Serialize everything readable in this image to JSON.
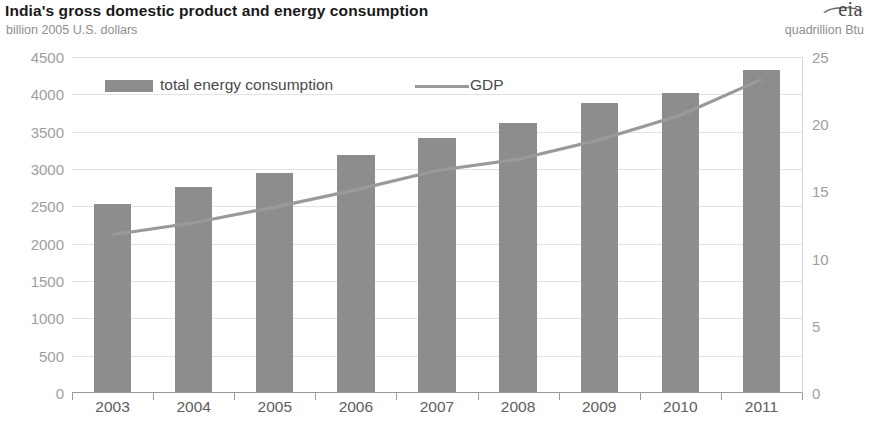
{
  "header": {
    "title": "India's gross domestic product and energy consumption",
    "subtitle_left": "billion 2005 U.S. dollars",
    "subtitle_right": "quadrillion Btu",
    "logo": "eia"
  },
  "legend": {
    "bars_label": "total energy consumption",
    "line_label": "GDP"
  },
  "colors": {
    "bar": "#8d8d8d",
    "line": "#9a9a9a",
    "grid": "#e2e2e2",
    "axis": "#9a9a9a",
    "title": "#1a1a1a",
    "tick": "#9e9e9e"
  },
  "chart_data": {
    "type": "bar",
    "title": "India's gross domestic product and energy consumption",
    "xlabel": "",
    "ylabel": "billion 2005 U.S. dollars",
    "y2label": "quadrillion Btu",
    "categories": [
      "2003",
      "2004",
      "2005",
      "2006",
      "2007",
      "2008",
      "2009",
      "2010",
      "2011"
    ],
    "ylim": [
      0,
      4500
    ],
    "y2lim": [
      0,
      25
    ],
    "yticks": [
      0,
      500,
      1000,
      1500,
      2000,
      2500,
      3000,
      3500,
      4000,
      4500
    ],
    "ytick_labels": [
      "0",
      "500",
      "1000",
      "1500",
      "2000",
      "2500",
      "3000",
      "3500",
      "4000",
      "4500"
    ],
    "y2ticks": [
      0,
      5,
      10,
      15,
      20,
      25
    ],
    "y2tick_labels": [
      "0",
      "5",
      "10",
      "15",
      "20",
      "25"
    ],
    "grid": true,
    "legend_position": "top-left",
    "series": [
      {
        "name": "total energy consumption",
        "type": "bar",
        "axis": "right",
        "units": "quadrillion Btu",
        "values": [
          14.1,
          15.3,
          16.4,
          17.7,
          19.0,
          20.1,
          21.6,
          22.3,
          24.0
        ]
      },
      {
        "name": "GDP",
        "type": "line",
        "axis": "left",
        "units": "billion 2005 U.S. dollars",
        "values": [
          2120,
          2280,
          2490,
          2720,
          2980,
          3130,
          3390,
          3720,
          4200
        ]
      }
    ]
  }
}
